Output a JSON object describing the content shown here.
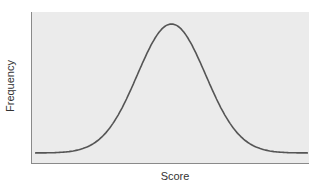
{
  "chart_data": {
    "type": "line",
    "title": "",
    "xlabel": "Score",
    "ylabel": "Frequency",
    "grid": false,
    "legend": null,
    "series": [
      {
        "name": "distribution",
        "color": "#555555",
        "x": [
          -4,
          -3.5,
          -3,
          -2.5,
          -2,
          -1.5,
          -1,
          -0.5,
          0,
          0.5,
          1,
          1.5,
          2,
          2.5,
          3,
          3.5,
          4
        ],
        "values": [
          0.0001,
          0.0009,
          0.0044,
          0.0175,
          0.054,
          0.1295,
          0.242,
          0.352,
          0.399,
          0.352,
          0.242,
          0.1295,
          0.054,
          0.0175,
          0.0044,
          0.0009,
          0.0001
        ]
      }
    ],
    "colors": {
      "plot_bg": "#ebebeb",
      "axis": "#8a8a8a",
      "line": "#555555"
    }
  }
}
